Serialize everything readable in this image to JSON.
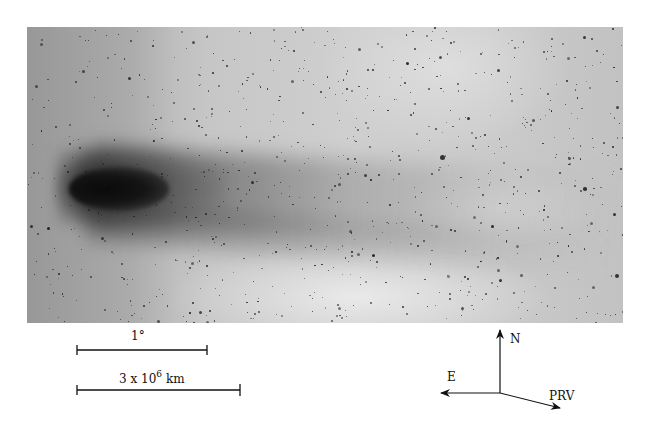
{
  "figure": {
    "type": "astronomical photograph",
    "colors": {
      "background": "#ffffff",
      "sky": "#c4c4c4",
      "coma": "#111111",
      "ink": "#111111"
    }
  },
  "scale_bars": [
    {
      "label": "1°"
    },
    {
      "label_base": "3 x 10",
      "label_exponent": "6",
      "label_unit": "km"
    }
  ],
  "compass": {
    "north_label": "N",
    "east_label": "E",
    "prv_label": "PRV"
  }
}
